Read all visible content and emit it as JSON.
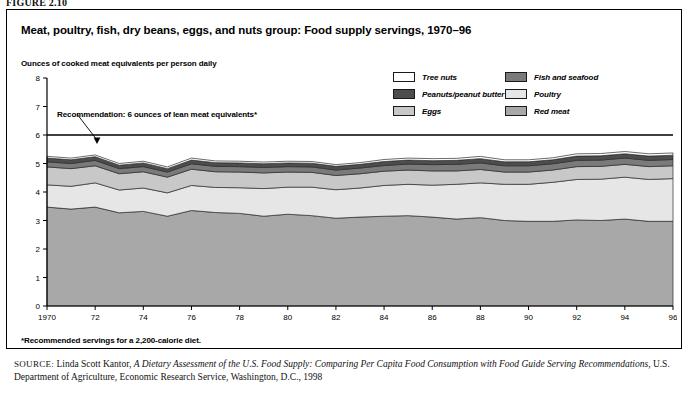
{
  "figure_label": "FIGURE 2.10",
  "chart_title": "Meat, poultry, fish, dry beans, eggs, and nuts group: Food supply servings, 1970–96",
  "axis_title": "Ounces of cooked meat equivalents per person daily",
  "annotation": "Recommendation: 6 ounces of lean meat equivalents*",
  "footnote": "*Recommended servings for a 2,200-calorie diet.",
  "source": {
    "label": "SOURCE:",
    "author": " Linda Scott Kantor, ",
    "title_italic": "A Dietary Assessment of the U.S. Food Supply: Comparing Per Capita Food Consumption with Food Guide Serving Recommendations",
    "rest": ", U.S. Department of Agriculture, Economic Research Service, Washington, D.C., 1998"
  },
  "legend": {
    "left": [
      {
        "label": "Tree nuts",
        "color": "#ffffff"
      },
      {
        "label": "Peanuts/peanut butter",
        "color": "#4d4d4d"
      },
      {
        "label": "Eggs",
        "color": "#c8c8c8"
      }
    ],
    "right": [
      {
        "label": "Fish and seafood",
        "color": "#7a7a7a"
      },
      {
        "label": "Poultry",
        "color": "#e6e6e6"
      },
      {
        "label": "Red meat",
        "color": "#a8a8a8"
      }
    ]
  },
  "chart_data": {
    "type": "area",
    "stacked": true,
    "title": "Meat, poultry, fish, dry beans, eggs, and nuts group: Food supply servings, 1970–96",
    "xlabel": "",
    "ylabel": "Ounces of cooked meat equivalents per person daily",
    "ylim": [
      0,
      8
    ],
    "yticks": [
      0,
      1,
      2,
      3,
      4,
      5,
      6,
      7,
      8
    ],
    "grid": false,
    "legend_position": "top-right",
    "x": [
      1970,
      1971,
      1972,
      1973,
      1974,
      1975,
      1976,
      1977,
      1978,
      1979,
      1980,
      1981,
      1982,
      1983,
      1984,
      1985,
      1986,
      1987,
      1988,
      1989,
      1990,
      1991,
      1992,
      1993,
      1994,
      1995,
      1996
    ],
    "xtick_labels": [
      "1970",
      "72",
      "74",
      "76",
      "78",
      "80",
      "82",
      "84",
      "86",
      "88",
      "90",
      "92",
      "94",
      "96"
    ],
    "xtick_values": [
      1970,
      1972,
      1974,
      1976,
      1978,
      1980,
      1982,
      1984,
      1986,
      1988,
      1990,
      1992,
      1994,
      1996
    ],
    "reference_line": {
      "value": 6,
      "label": "Recommendation: 6 ounces of lean meat equivalents*"
    },
    "series": [
      {
        "name": "Red meat",
        "color": "#a8a8a8",
        "values": [
          3.47,
          3.4,
          3.47,
          3.27,
          3.32,
          3.15,
          3.35,
          3.28,
          3.25,
          3.15,
          3.22,
          3.17,
          3.08,
          3.12,
          3.15,
          3.17,
          3.12,
          3.05,
          3.1,
          3.0,
          2.97,
          2.97,
          3.02,
          3.0,
          3.05,
          2.97,
          2.97
        ]
      },
      {
        "name": "Poultry",
        "color": "#e6e6e6",
        "values": [
          0.78,
          0.8,
          0.85,
          0.8,
          0.82,
          0.82,
          0.88,
          0.88,
          0.9,
          0.97,
          0.95,
          1.0,
          1.0,
          1.02,
          1.08,
          1.1,
          1.12,
          1.22,
          1.22,
          1.27,
          1.3,
          1.37,
          1.42,
          1.45,
          1.47,
          1.47,
          1.5
        ]
      },
      {
        "name": "Eggs",
        "color": "#c8c8c8",
        "values": [
          0.63,
          0.62,
          0.6,
          0.57,
          0.57,
          0.55,
          0.57,
          0.55,
          0.55,
          0.55,
          0.53,
          0.52,
          0.5,
          0.5,
          0.5,
          0.5,
          0.5,
          0.47,
          0.47,
          0.43,
          0.43,
          0.43,
          0.45,
          0.45,
          0.45,
          0.45,
          0.45
        ]
      },
      {
        "name": "Fish and seafood",
        "color": "#7a7a7a",
        "values": [
          0.18,
          0.18,
          0.19,
          0.18,
          0.18,
          0.18,
          0.19,
          0.19,
          0.19,
          0.19,
          0.19,
          0.19,
          0.19,
          0.2,
          0.2,
          0.21,
          0.22,
          0.23,
          0.23,
          0.22,
          0.22,
          0.22,
          0.22,
          0.22,
          0.22,
          0.22,
          0.22
        ]
      },
      {
        "name": "Peanuts/peanut butter",
        "color": "#4d4d4d",
        "values": [
          0.13,
          0.13,
          0.13,
          0.12,
          0.13,
          0.12,
          0.13,
          0.13,
          0.13,
          0.13,
          0.13,
          0.13,
          0.13,
          0.13,
          0.14,
          0.14,
          0.14,
          0.14,
          0.15,
          0.14,
          0.14,
          0.14,
          0.15,
          0.15,
          0.15,
          0.15,
          0.15
        ]
      },
      {
        "name": "Tree nuts",
        "color": "#ffffff",
        "values": [
          0.06,
          0.06,
          0.06,
          0.06,
          0.06,
          0.06,
          0.07,
          0.06,
          0.06,
          0.06,
          0.06,
          0.06,
          0.06,
          0.06,
          0.07,
          0.07,
          0.07,
          0.07,
          0.08,
          0.07,
          0.07,
          0.07,
          0.08,
          0.08,
          0.08,
          0.08,
          0.08
        ]
      }
    ]
  }
}
